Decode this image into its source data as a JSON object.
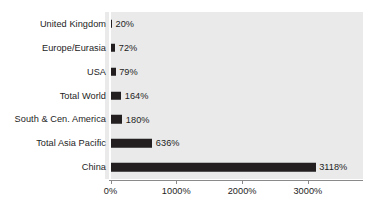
{
  "chart_data": {
    "type": "bar",
    "orientation": "horizontal",
    "title": "",
    "subtitle": "",
    "xlabel": "",
    "ylabel": "",
    "categories": [
      "United Kingdom",
      "Europe/Eurasia",
      "USA",
      "Total World",
      "South & Cen. America",
      "Total Asia Pacific",
      "China"
    ],
    "values": [
      20,
      72,
      79,
      164,
      180,
      636,
      3118
    ],
    "value_labels": [
      "20%",
      "72%",
      "79%",
      "164%",
      "180%",
      "636%",
      "3118%"
    ],
    "xlim": [
      0,
      3850
    ],
    "xticks": [
      0,
      1000,
      2000,
      3000
    ],
    "xtick_labels": [
      "0%",
      "1000%",
      "2000%",
      "3000%"
    ],
    "grid": false,
    "legend": null,
    "series": [
      {
        "name": "",
        "values": [
          20,
          72,
          79,
          164,
          180,
          636,
          3118
        ]
      }
    ],
    "colors": {
      "bar": "#231f20",
      "plot_background": "#eaeaea",
      "page_background": "#ffffff",
      "axis": "#8a8a8a",
      "text": "#1d1d1d"
    }
  }
}
